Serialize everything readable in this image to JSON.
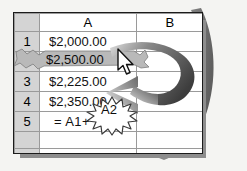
{
  "app": {
    "type": "spreadsheet-illustration",
    "title": "Spreadsheet cell reference illustration"
  },
  "colors": {
    "background": "#f4f4f2",
    "sheet_background": "#ffffff",
    "header_fill": "#d4d4d4",
    "gridline": "#9a9a9a",
    "sheet_border": "#1b1b1b",
    "selection_fill": "#b9b9b9",
    "arrow_dark": "#4c4c4c",
    "arrow_light": "#d8d8d8",
    "shadow": "#8d8d8d",
    "text": "#111111"
  },
  "grid": {
    "corner_label": "",
    "column_headers": [
      "A",
      "B"
    ],
    "row_headers": [
      "1",
      "2",
      "3",
      "4",
      "5",
      "",
      ""
    ],
    "rows": [
      {
        "row_header": "1",
        "a": "$2,000.00",
        "b": "",
        "selected": false
      },
      {
        "row_header": "2",
        "a": "$2,500.00",
        "b": "",
        "selected": true
      },
      {
        "row_header": "3",
        "a": "$2,225.00",
        "b": "",
        "selected": false
      },
      {
        "row_header": "4",
        "a": "$2,350.00",
        "b": "",
        "selected": false
      },
      {
        "row_header": "5",
        "a": "= A1+  A2",
        "b": "",
        "selected": false
      },
      {
        "row_header": "",
        "a": "",
        "b": "",
        "selected": false
      },
      {
        "row_header": "",
        "a": "",
        "b": "",
        "selected": false
      }
    ]
  },
  "callouts": {
    "selected_cell_value": "$2,500.00",
    "selected_cell_reference": "A2",
    "formula_prefix": "= A1+",
    "formula_highlight": "A2",
    "arrow_name": "curved-ribbon-arrow",
    "burst_name": "starburst-highlight",
    "cursor_name": "mouse-pointer"
  }
}
